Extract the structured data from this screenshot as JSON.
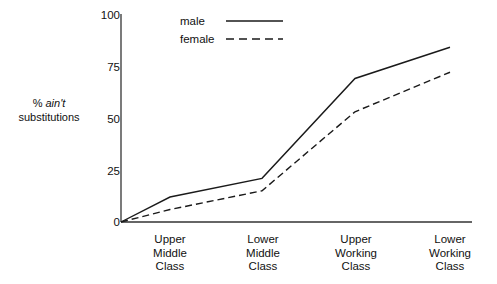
{
  "chart_data": {
    "type": "line",
    "title": "",
    "xlabel": "",
    "ylabel": "% ain't substitutions",
    "ylabel_plain": "% ",
    "ylabel_italic": "ain't",
    "ylabel_rest": "substitutions",
    "categories": [
      "Upper Middle Class",
      "Lower Middle Class",
      "Upper Working Class",
      "Lower Working Class"
    ],
    "category_lines": [
      [
        "Upper",
        "Middle",
        "Class"
      ],
      [
        "Lower",
        "Middle",
        "Class"
      ],
      [
        "Upper",
        "Working",
        "Class"
      ],
      [
        "Lower",
        "Working",
        "Class"
      ]
    ],
    "ylim": [
      0,
      100
    ],
    "yticks": [
      0,
      25,
      50,
      75,
      100
    ],
    "ytick_labels": [
      "0",
      "25",
      "50",
      "75",
      "100"
    ],
    "grid": false,
    "legend_position": "top-center",
    "origin_value": 0,
    "series": [
      {
        "name": "male",
        "style": "solid",
        "color": "#1a1a1a",
        "values": [
          12,
          21,
          69,
          84
        ],
        "origin": 0
      },
      {
        "name": "female",
        "style": "dashed",
        "color": "#1a1a1a",
        "values": [
          6,
          15,
          53,
          72
        ],
        "origin": 0
      }
    ]
  },
  "legend": {
    "items": [
      {
        "label": "male",
        "style": "solid"
      },
      {
        "label": "female",
        "style": "dashed"
      }
    ]
  },
  "axis": {
    "y_label_line1_prefix": "% ",
    "y_label_line1_italic": "ain't",
    "y_label_line2": "substitutions"
  }
}
